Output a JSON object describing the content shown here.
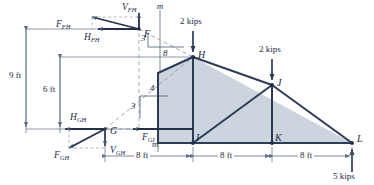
{
  "figure": {
    "colors": {
      "shade": "#ccd4de",
      "member": "#2c3c57",
      "thin": "#5b6b86",
      "text": "#1b2a43",
      "dash": "#8e9aae",
      "background": "#ffffff"
    }
  },
  "joints": [
    {
      "id": "F",
      "label": "F",
      "x": 139,
      "y": 29
    },
    {
      "id": "G",
      "label": "G",
      "x": 105,
      "y": 129
    },
    {
      "id": "H",
      "label": "H",
      "x": 193,
      "y": 57
    },
    {
      "id": "I",
      "label": "I",
      "x": 193,
      "y": 143
    },
    {
      "id": "J",
      "label": "J",
      "x": 272,
      "y": 85
    },
    {
      "id": "K",
      "label": "K",
      "x": 272,
      "y": 143
    },
    {
      "id": "L",
      "label": "L",
      "x": 352,
      "y": 143
    }
  ],
  "forces": [
    {
      "name": "V_FH",
      "base": "V",
      "sub": "FH",
      "x": 122,
      "y": 5
    },
    {
      "name": "F_FH",
      "base": "F",
      "sub": "FH",
      "x": 56,
      "y": 22
    },
    {
      "name": "H_FH",
      "base": "H",
      "sub": "FH",
      "x": 84,
      "y": 39
    },
    {
      "name": "H_GH",
      "base": "H",
      "sub": "GH",
      "x": 72,
      "y": 113
    },
    {
      "name": "F_GH",
      "base": "F",
      "sub": "GH",
      "x": 58,
      "y": 148
    },
    {
      "name": "V_GH",
      "base": "V",
      "sub": "GH",
      "x": 110,
      "y": 147
    },
    {
      "name": "F_GI",
      "base": "F",
      "sub": "GI",
      "x": 140,
      "y": 132
    }
  ],
  "loads": [
    {
      "label": "2 kips",
      "x": 183,
      "y": 22,
      "at": "H"
    },
    {
      "label": "2 kips",
      "x": 262,
      "y": 50,
      "at": "J"
    },
    {
      "label": "5 kips",
      "x": 333,
      "y": 172,
      "at": "L"
    }
  ],
  "dimensions": {
    "vertical": [
      {
        "label": "9 ft",
        "x": 10,
        "y": 52
      },
      {
        "label": "6 ft",
        "x": 44,
        "y": 80
      }
    ],
    "horizontal": [
      {
        "label": "8 ft",
        "x": 132,
        "y": 164
      },
      {
        "label": "8 ft",
        "x": 215,
        "y": 164
      },
      {
        "label": "8 ft",
        "x": 297,
        "y": 164
      }
    ]
  },
  "slope_triangles": [
    {
      "id": "upper",
      "rise": "3",
      "run": "8",
      "rise_x": 150,
      "rise_y": 37,
      "run_x": 166,
      "run_y": 50
    },
    {
      "id": "lower",
      "rise": "3",
      "run": "4",
      "rise_x": 134,
      "rise_y": 109,
      "run_x": 146,
      "run_y": 88
    }
  ],
  "section_marks": [
    {
      "label": "m",
      "x": 160,
      "y": 4
    },
    {
      "label": "m",
      "x": 152,
      "y": 140
    }
  ]
}
